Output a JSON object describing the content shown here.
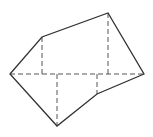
{
  "diagram": {
    "type": "geometry-figure",
    "colors": {
      "background": "#ffffff",
      "solid_stroke": "#333333",
      "dashed_stroke": "#555555"
    },
    "vertices": [
      {
        "id": "left",
        "x": 10,
        "y": 74
      },
      {
        "id": "upper-left",
        "x": 42,
        "y": 37
      },
      {
        "id": "top",
        "x": 108,
        "y": 13
      },
      {
        "id": "right",
        "x": 144,
        "y": 74
      },
      {
        "id": "lower-right",
        "x": 97,
        "y": 94
      },
      {
        "id": "bottom",
        "x": 57,
        "y": 126
      }
    ],
    "dashed_lines": [
      {
        "id": "baseline",
        "x1": 10,
        "y1": 74,
        "x2": 144,
        "y2": 74
      },
      {
        "id": "perp-upper-left",
        "x1": 42,
        "y1": 37,
        "x2": 42,
        "y2": 74
      },
      {
        "id": "perp-top",
        "x1": 108,
        "y1": 13,
        "x2": 108,
        "y2": 74
      },
      {
        "id": "perp-bottom",
        "x1": 57,
        "y1": 74,
        "x2": 57,
        "y2": 126
      },
      {
        "id": "perp-lower-right",
        "x1": 97,
        "y1": 74,
        "x2": 97,
        "y2": 94
      }
    ]
  }
}
